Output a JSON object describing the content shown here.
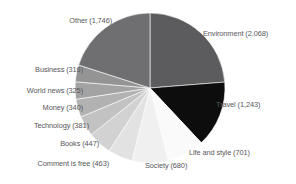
{
  "chart_data": {
    "type": "pie",
    "title": "",
    "subtitle": "",
    "xlabel": "",
    "ylabel": "",
    "legend_position": "none",
    "grid": false,
    "label_format": "{name} ({value})",
    "total": 8710,
    "categories": [
      "Environment",
      "Travel",
      "Life and style",
      "Society",
      "Comment is free",
      "Books",
      "Technology",
      "Money",
      "World news",
      "Business",
      "Other"
    ],
    "values": [
      2068,
      1243,
      701,
      680,
      463,
      447,
      381,
      340,
      325,
      316,
      1746
    ],
    "colors": [
      "#5c5c5e",
      "#0d0d0d",
      "#fafafa",
      "#f0f0f0",
      "#e2e2e2",
      "#d2d2d2",
      "#c2c2c2",
      "#b2b2b2",
      "#a3a3a3",
      "#949494",
      "#6f6f71"
    ],
    "slices": [
      {
        "name": "Environment",
        "value": "2,068",
        "label": "Environment (2,068)",
        "color": "#5c5c5e"
      },
      {
        "name": "Travel",
        "value": "1,243",
        "label": "Travel (1,243)",
        "color": "#0d0d0d"
      },
      {
        "name": "Life and style",
        "value": "701",
        "label": "Life and style (701)",
        "color": "#fafafa"
      },
      {
        "name": "Society",
        "value": "680",
        "label": "Society (680)",
        "color": "#f0f0f0"
      },
      {
        "name": "Comment is free",
        "value": "463",
        "label": "Comment is free (463)",
        "color": "#e2e2e2"
      },
      {
        "name": "Books",
        "value": "447",
        "label": "Books (447)",
        "color": "#d2d2d2"
      },
      {
        "name": "Technology",
        "value": "381",
        "label": "Technology (381)",
        "color": "#c2c2c2"
      },
      {
        "name": "Money",
        "value": "340",
        "label": "Money (340)",
        "color": "#b2b2b2"
      },
      {
        "name": "World news",
        "value": "325",
        "label": "World news (325)",
        "color": "#a3a3a3"
      },
      {
        "name": "Business",
        "value": "316",
        "label": "Business (316)",
        "color": "#949494"
      },
      {
        "name": "Other",
        "value": "1,746",
        "label": "Other (1,746)",
        "color": "#6f6f71"
      }
    ]
  },
  "geometry": {
    "cx": 150,
    "cy": 88,
    "r": 75,
    "start_angle_deg": 0,
    "direction": "clockwise"
  }
}
